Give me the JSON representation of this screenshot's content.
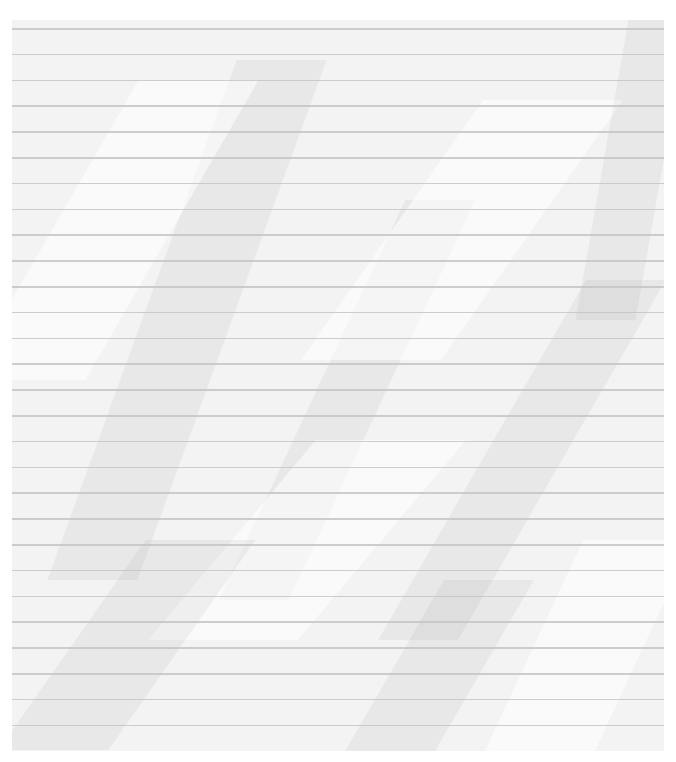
{
  "image": {
    "subject": "crumpled lined paper",
    "text_content": "",
    "paper_color": "#f3f3f3",
    "rule_color": "#c4c4c4",
    "rule_count": 28
  }
}
